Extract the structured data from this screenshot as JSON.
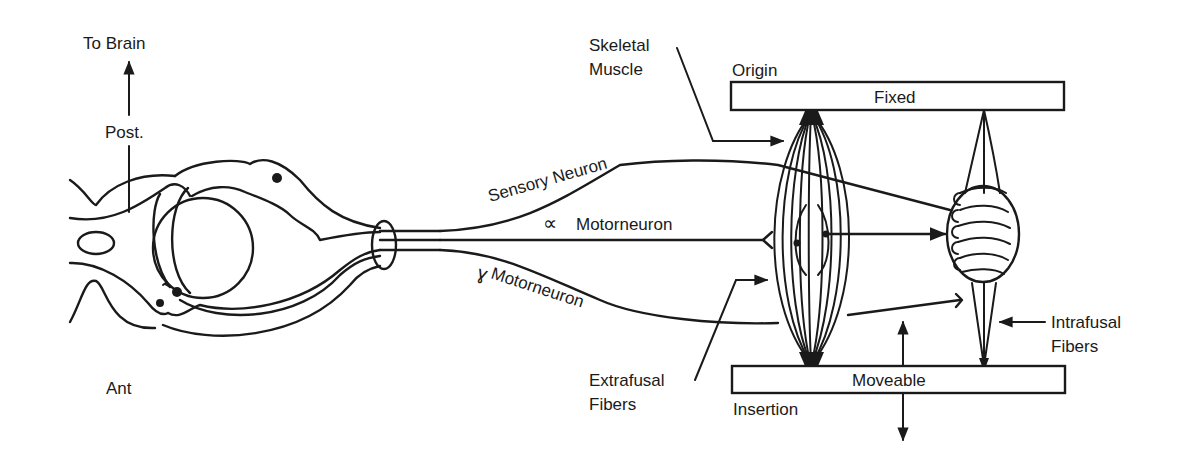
{
  "diagram": {
    "labels": {
      "to_brain": "To Brain",
      "posterior": "Post.",
      "anterior": "Ant",
      "sensory_neuron": "Sensory Neuron",
      "alpha_symbol": "∝",
      "alpha_motorneuron": "Motorneuron",
      "gamma_symbol": "ɣ",
      "gamma_motorneuron": "Motorneuron",
      "skeletal_muscle_1": "Skeletal",
      "skeletal_muscle_2": "Muscle",
      "origin": "Origin",
      "fixed": "Fixed",
      "moveable": "Moveable",
      "insertion": "Insertion",
      "extrafusal_1": "Extrafusal",
      "extrafusal_2": "Fibers",
      "intrafusal_1": "Intrafusal",
      "intrafusal_2": "Fibers"
    },
    "colors": {
      "ink": "#1a1a1a",
      "background": "#ffffff"
    }
  }
}
